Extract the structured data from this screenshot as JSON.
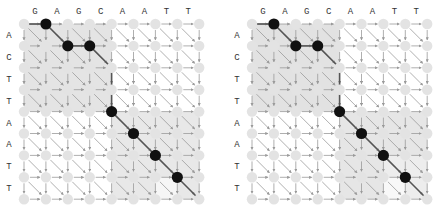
{
  "figure": {
    "panels": [
      {
        "id": "left",
        "top_sequence": [
          "G",
          "A",
          "G",
          "C",
          "A",
          "A",
          "T",
          "T"
        ],
        "left_sequence": [
          "A",
          "C",
          "T",
          "T",
          "A",
          "A",
          "T",
          "T"
        ],
        "path_nodes": [
          [
            0,
            1
          ],
          [
            1,
            2
          ],
          [
            1,
            3
          ],
          [
            4,
            4
          ],
          [
            5,
            5
          ],
          [
            6,
            6
          ],
          [
            7,
            7
          ]
        ],
        "path_edges": [
          [
            [
              0,
              0
            ],
            [
              0,
              1
            ]
          ],
          [
            [
              0,
              1
            ],
            [
              1,
              2
            ]
          ],
          [
            [
              1,
              2
            ],
            [
              1,
              3
            ]
          ],
          [
            [
              1,
              3
            ],
            [
              2,
              4
            ]
          ],
          [
            [
              2,
              4
            ],
            [
              3,
              4
            ]
          ],
          [
            [
              3,
              4
            ],
            [
              4,
              4
            ]
          ],
          [
            [
              4,
              4
            ],
            [
              5,
              5
            ]
          ],
          [
            [
              5,
              5
            ],
            [
              6,
              6
            ]
          ],
          [
            [
              6,
              6
            ],
            [
              7,
              7
            ]
          ],
          [
            [
              7,
              7
            ],
            [
              8,
              8
            ]
          ]
        ],
        "shaded_blocks": [
          {
            "r0": 0,
            "c0": 0,
            "r1": 4,
            "c1": 4,
            "shade": "#e4e4e4"
          },
          {
            "r0": 4,
            "c0": 4,
            "r1": 8,
            "c1": 8,
            "shade": "#e8e8e8"
          },
          {
            "r0": 7,
            "c0": 6,
            "r1": 8,
            "c1": 7,
            "shade": "#f6f6f6"
          }
        ]
      },
      {
        "id": "right",
        "top_sequence": [
          "G",
          "A",
          "G",
          "C",
          "A",
          "A",
          "T",
          "T"
        ],
        "left_sequence": [
          "A",
          "C",
          "T",
          "T",
          "A",
          "A",
          "T",
          "T"
        ],
        "path_nodes": [
          [
            0,
            1
          ],
          [
            1,
            2
          ],
          [
            1,
            3
          ],
          [
            4,
            4
          ],
          [
            5,
            5
          ],
          [
            6,
            6
          ],
          [
            7,
            7
          ]
        ],
        "path_edges": [
          [
            [
              0,
              0
            ],
            [
              0,
              1
            ]
          ],
          [
            [
              0,
              1
            ],
            [
              1,
              2
            ]
          ],
          [
            [
              1,
              2
            ],
            [
              1,
              3
            ]
          ],
          [
            [
              1,
              3
            ],
            [
              2,
              4
            ]
          ],
          [
            [
              2,
              4
            ],
            [
              3,
              4
            ]
          ],
          [
            [
              3,
              4
            ],
            [
              4,
              4
            ]
          ],
          [
            [
              4,
              4
            ],
            [
              5,
              5
            ]
          ],
          [
            [
              5,
              5
            ],
            [
              6,
              6
            ]
          ],
          [
            [
              6,
              6
            ],
            [
              7,
              7
            ]
          ],
          [
            [
              7,
              7
            ],
            [
              8,
              8
            ]
          ]
        ],
        "shaded_blocks": [
          {
            "r0": 0,
            "c0": 0,
            "r1": 4,
            "c1": 4,
            "shade": "#e2e2e2"
          },
          {
            "r0": 4,
            "c0": 4,
            "r1": 8,
            "c1": 8,
            "shade": "#e6e6e6"
          },
          {
            "r0": 6,
            "c0": 6,
            "r1": 8,
            "c1": 8,
            "shade": "#ededed"
          },
          {
            "r0": 7,
            "c0": 6,
            "r1": 8,
            "c1": 7,
            "shade": "#f8f8f8"
          }
        ]
      }
    ],
    "colors": {
      "node": "#e3e3e3",
      "path_node": "#111111",
      "edge": "#9a9a9a",
      "path_edge": "#555555",
      "label": "#333333"
    }
  }
}
